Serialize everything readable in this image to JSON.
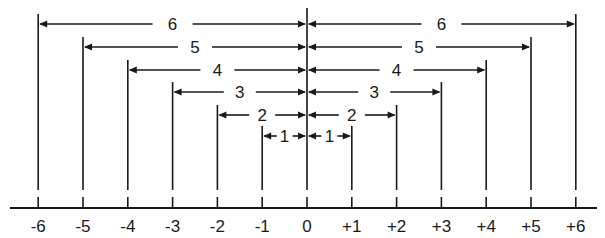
{
  "diagram": {
    "axis": {
      "ticks": [
        {
          "value": -6,
          "label": "-6"
        },
        {
          "value": -5,
          "label": "-5"
        },
        {
          "value": -4,
          "label": "-4"
        },
        {
          "value": -3,
          "label": "-3"
        },
        {
          "value": -2,
          "label": "-2"
        },
        {
          "value": -1,
          "label": "-1"
        },
        {
          "value": 0,
          "label": "0"
        },
        {
          "value": 1,
          "label": "+1"
        },
        {
          "value": 2,
          "label": "+2"
        },
        {
          "value": 3,
          "label": "+3"
        },
        {
          "value": 4,
          "label": "+4"
        },
        {
          "value": 5,
          "label": "+5"
        },
        {
          "value": 6,
          "label": "+6"
        }
      ]
    },
    "dimensions": [
      {
        "distance": 6,
        "left_label": "6",
        "right_label": "6"
      },
      {
        "distance": 5,
        "left_label": "5",
        "right_label": "5"
      },
      {
        "distance": 4,
        "left_label": "4",
        "right_label": "4"
      },
      {
        "distance": 3,
        "left_label": "3",
        "right_label": "3"
      },
      {
        "distance": 2,
        "left_label": "2",
        "right_label": "2"
      },
      {
        "distance": 1,
        "left_label": "1",
        "right_label": "1"
      }
    ],
    "colors": {
      "ink": "#1a1a1a",
      "background": "#ffffff"
    }
  }
}
